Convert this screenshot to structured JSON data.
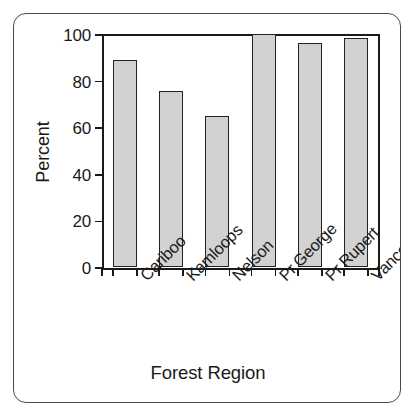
{
  "figure": {
    "frame_border_color": "#4a4a4a",
    "background_color": "#ffffff"
  },
  "chart_data": {
    "type": "bar",
    "title": "",
    "subtitle": "",
    "xlabel": "Forest Region",
    "ylabel": "Percent",
    "categories": [
      "Cariboo",
      "Kamloops",
      "Nelson",
      "Pr.George",
      "Pr.Rupert",
      "Vancouver"
    ],
    "values": [
      89,
      75.5,
      65,
      100,
      96,
      98.5
    ],
    "ylim": [
      0,
      100
    ],
    "yticks": [
      0,
      20,
      40,
      60,
      80,
      100
    ],
    "ytick_labels": [
      "0",
      "20",
      "40",
      "60",
      "80",
      "100"
    ],
    "grid": false,
    "legend": null,
    "bar_fill_color": "#d2d2d2",
    "bar_edge_color": "#222222",
    "axis_color": "#1a1a1a",
    "xtick_label_rotation": -45
  }
}
